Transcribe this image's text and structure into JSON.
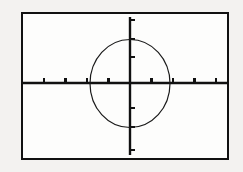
{
  "document": {
    "title": "Graphing calculator screen with circle graph",
    "background_color": "#f3f2f0",
    "ink_color": "#111111",
    "width": 243,
    "height": 172
  },
  "screen": {
    "name": "calculator-graph-screen",
    "border_color": "#111111",
    "border_width": 2,
    "fill_color": "#fdfdfc",
    "bounds": {
      "x": 21,
      "y": 12,
      "width": 208,
      "height": 148
    }
  },
  "chart_data": {
    "type": "line",
    "title": "",
    "subtitle": "",
    "xlabel": "",
    "ylabel": "",
    "grid": false,
    "legend": null,
    "axes": {
      "x_axis": {
        "name": "x-axis",
        "y_pixel": 83,
        "x_start_pixel": 22,
        "x_end_pixel": 228,
        "origin_pixel": 130,
        "tick_spacing_pixels": 21.5,
        "tick_pixels": [
          44,
          65.5,
          87,
          108.5,
          151.5,
          173,
          194.5,
          216
        ],
        "tick_length": 5,
        "tick_labels": [],
        "range": [
          -4.7,
          4.7
        ],
        "scale_per_tick": 1
      },
      "y_axis": {
        "name": "y-axis",
        "x_pixel": 130,
        "y_start_pixel": 17,
        "y_end_pixel": 155,
        "origin_pixel": 83,
        "tick_spacing_pixels": 22,
        "tick_pixels": [
          20,
          39,
          57,
          108,
          127,
          150
        ],
        "tick_length": 5,
        "tick_labels": [],
        "range": [
          -3.1,
          3.1
        ],
        "scale_per_tick": 1
      }
    },
    "series": [
      {
        "name": "circle",
        "shape": "ellipse",
        "center_pixel": [
          130,
          83.5
        ],
        "radius_x_pixel": 40,
        "radius_y_pixel": 44,
        "center_value": [
          0,
          0
        ],
        "radius_x_value": 1.85,
        "radius_y_value": 2.0,
        "stroke_color": "#1a1a1a",
        "stroke_width": 1,
        "fill": "none",
        "equation": "x^2 + y^2 = r^2"
      }
    ]
  }
}
